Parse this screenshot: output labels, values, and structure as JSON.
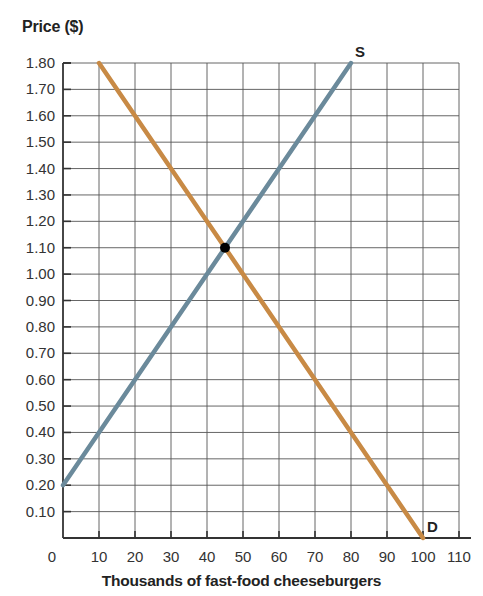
{
  "header": {
    "clipped_text": "EXHIBIT 3"
  },
  "chart_data": {
    "type": "line",
    "title": "",
    "xlabel": "Thousands of fast-food cheeseburgers",
    "ylabel": "Price ($)",
    "xlim": [
      0,
      110
    ],
    "ylim": [
      0,
      1.8
    ],
    "grid": true,
    "x_ticks": [
      0,
      10,
      20,
      30,
      40,
      50,
      60,
      70,
      80,
      90,
      100,
      110
    ],
    "y_ticks": [
      0.1,
      0.2,
      0.3,
      0.4,
      0.5,
      0.6,
      0.7,
      0.8,
      0.9,
      1.0,
      1.1,
      1.2,
      1.3,
      1.4,
      1.5,
      1.6,
      1.7,
      1.8
    ],
    "x_tick_labels": [
      "0",
      "10",
      "20",
      "30",
      "40",
      "50",
      "60",
      "70",
      "80",
      "90",
      "100",
      "110"
    ],
    "y_tick_labels": [
      "0.10",
      "0.20",
      "0.30",
      "0.40",
      "0.50",
      "0.60",
      "0.70",
      "0.80",
      "0.90",
      "1.00",
      "1.10",
      "1.20",
      "1.30",
      "1.40",
      "1.50",
      "1.60",
      "1.70",
      "1.80"
    ],
    "series": [
      {
        "name": "S",
        "label": "Supply",
        "color": "#6B8A9B",
        "x": [
          0,
          80
        ],
        "y": [
          0.2,
          1.8
        ]
      },
      {
        "name": "D",
        "label": "Demand",
        "color": "#C88A45",
        "x": [
          10,
          100
        ],
        "y": [
          1.8,
          0
        ]
      }
    ],
    "annotations": [
      {
        "type": "point",
        "label": "equilibrium",
        "x": 45,
        "y": 1.1,
        "color": "#000000"
      },
      {
        "type": "text",
        "text": "S",
        "x": 80,
        "y": 1.8
      },
      {
        "type": "text",
        "text": "D",
        "x": 100,
        "y": 0
      }
    ]
  },
  "colors": {
    "supply": "#6B8A9B",
    "demand": "#C88A45",
    "grid": "#555555",
    "axis": "#333333",
    "point": "#000000"
  }
}
